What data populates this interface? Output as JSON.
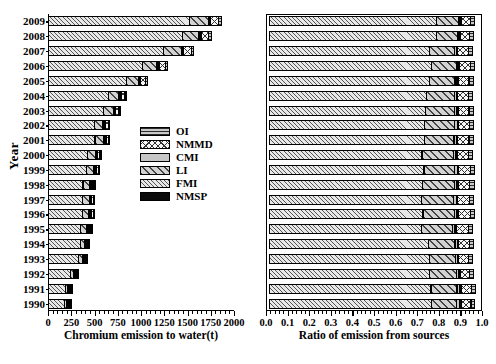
{
  "chart_data": {
    "type": "bar",
    "orientation": "horizontal",
    "stacked": true,
    "title": "",
    "panels": [
      {
        "id": "absolute",
        "xlabel": "Chromium emission to water(t)",
        "xlim": [
          0,
          2000
        ],
        "xticks": [
          0,
          250,
          500,
          750,
          1000,
          1250,
          1500,
          1750,
          2000
        ],
        "xtick_labels": [
          "0",
          "250",
          "500",
          "750",
          "1000",
          "1250",
          "1500",
          "1750",
          "2000"
        ],
        "minor_tick_count": 5
      },
      {
        "id": "ratio",
        "xlabel": "Ratio of emission from sources",
        "xlim": [
          0,
          1
        ],
        "xticks": [
          0.0,
          0.1,
          0.2,
          0.3,
          0.4,
          0.5,
          0.6,
          0.7,
          0.8,
          0.9,
          1.0
        ],
        "xtick_labels": [
          "0.0",
          "0.1",
          "0.2",
          "0.3",
          "0.4",
          "0.5",
          "0.6",
          "0.7",
          "0.8",
          "0.9",
          "1.0"
        ],
        "minor_tick_count": 5
      }
    ],
    "ylabel": "Year",
    "categories": [
      "2009",
      "2008",
      "2007",
      "2006",
      "2005",
      "2004",
      "2003",
      "2002",
      "2001",
      "2000",
      "1999",
      "1998",
      "1997",
      "1996",
      "1995",
      "1994",
      "1993",
      "1992",
      "1991",
      "1990"
    ],
    "legend": {
      "position": "center-left-inside",
      "entries": [
        {
          "name": "OI",
          "pattern": "horizontal-lines"
        },
        {
          "name": "NMMD",
          "pattern": "cross-hatch"
        },
        {
          "name": "CMI",
          "pattern": "solid-gray"
        },
        {
          "name": "LI",
          "pattern": "diagonal-hatch-wide"
        },
        {
          "name": "FMI",
          "pattern": "diagonal-hatch-fine"
        },
        {
          "name": "NMSP",
          "pattern": "solid-black"
        }
      ]
    },
    "series_order": [
      "FMI",
      "LI",
      "CMI",
      "NMSP",
      "NMMD",
      "OI"
    ],
    "series": [
      {
        "name": "FMI",
        "values": [
          1530,
          1450,
          1245,
          1020,
          845,
          655,
          600,
          505,
          510,
          430,
          420,
          380,
          375,
          375,
          355,
          350,
          335,
          245,
          195,
          185
        ]
      },
      {
        "name": "LI",
        "values": [
          205,
          185,
          200,
          165,
          140,
          120,
          115,
          100,
          100,
          90,
          85,
          80,
          80,
          78,
          75,
          60,
          55,
          42,
          32,
          30
        ]
      },
      {
        "name": "CMI",
        "values": [
          22,
          20,
          20,
          16,
          14,
          12,
          11,
          10,
          10,
          9,
          9,
          8,
          8,
          8,
          8,
          7,
          6,
          5,
          4,
          4
        ]
      },
      {
        "name": "NMSP",
        "values": [
          16,
          15,
          15,
          12,
          10,
          9,
          8,
          7,
          7,
          6,
          6,
          6,
          6,
          6,
          6,
          5,
          4,
          3,
          3,
          3
        ]
      },
      {
        "name": "NMMD",
        "values": [
          95,
          88,
          92,
          72,
          62,
          48,
          45,
          38,
          40,
          34,
          33,
          30,
          30,
          30,
          29,
          25,
          22,
          16,
          13,
          12
        ]
      },
      {
        "name": "OI",
        "values": [
          40,
          38,
          38,
          30,
          26,
          21,
          19,
          16,
          17,
          15,
          14,
          13,
          13,
          13,
          12,
          11,
          10,
          7,
          6,
          5
        ]
      }
    ],
    "ratios": [
      {
        "name": "FMI",
        "values": [
          0.803,
          0.805,
          0.769,
          0.779,
          0.769,
          0.755,
          0.75,
          0.747,
          0.745,
          0.734,
          0.744,
          0.737,
          0.733,
          0.739,
          0.73,
          0.765,
          0.771,
          0.77,
          0.777,
          0.778
        ]
      },
      {
        "name": "LI",
        "values": [
          0.108,
          0.103,
          0.124,
          0.126,
          0.127,
          0.138,
          0.144,
          0.148,
          0.146,
          0.154,
          0.151,
          0.155,
          0.156,
          0.154,
          0.154,
          0.131,
          0.127,
          0.132,
          0.128,
          0.126
        ]
      },
      {
        "name": "CMI",
        "values": [
          0.012,
          0.011,
          0.012,
          0.012,
          0.013,
          0.014,
          0.014,
          0.015,
          0.015,
          0.015,
          0.016,
          0.016,
          0.016,
          0.016,
          0.016,
          0.015,
          0.014,
          0.016,
          0.016,
          0.017
        ]
      },
      {
        "name": "NMSP",
        "values": [
          0.008,
          0.008,
          0.009,
          0.009,
          0.009,
          0.01,
          0.01,
          0.01,
          0.01,
          0.01,
          0.011,
          0.012,
          0.012,
          0.012,
          0.012,
          0.011,
          0.009,
          0.009,
          0.012,
          0.013
        ]
      },
      {
        "name": "NMMD",
        "values": [
          0.05,
          0.049,
          0.057,
          0.055,
          0.056,
          0.055,
          0.056,
          0.056,
          0.058,
          0.058,
          0.058,
          0.058,
          0.059,
          0.059,
          0.06,
          0.055,
          0.051,
          0.05,
          0.052,
          0.05
        ]
      },
      {
        "name": "OI",
        "values": [
          0.021,
          0.021,
          0.023,
          0.023,
          0.024,
          0.024,
          0.024,
          0.024,
          0.025,
          0.026,
          0.025,
          0.025,
          0.025,
          0.026,
          0.025,
          0.024,
          0.023,
          0.022,
          0.024,
          0.021
        ]
      }
    ]
  }
}
